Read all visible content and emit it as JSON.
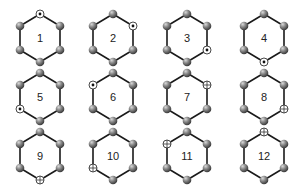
{
  "diagram": {
    "title": "",
    "colors": {
      "bond": "#1a1a1a",
      "atom": "#6b6b6b",
      "atom_highlight": "#bdbdbd",
      "marker_fill": "#ffffff",
      "marker_stroke": "#333333",
      "label": "#222222"
    },
    "vertex_order": [
      "top",
      "upper-right",
      "lower-right",
      "bottom",
      "lower-left",
      "upper-left"
    ],
    "hexagons": [
      {
        "label": "1",
        "cx": 40,
        "cy": 38,
        "marker_vertex": "top",
        "marker_type": "dot"
      },
      {
        "label": "2",
        "cx": 113,
        "cy": 38,
        "marker_vertex": "upper-right",
        "marker_type": "dot"
      },
      {
        "label": "3",
        "cx": 187,
        "cy": 38,
        "marker_vertex": "lower-right",
        "marker_type": "dot"
      },
      {
        "label": "4",
        "cx": 264,
        "cy": 38,
        "marker_vertex": "bottom",
        "marker_type": "dot"
      },
      {
        "label": "5",
        "cx": 40,
        "cy": 97,
        "marker_vertex": "lower-left",
        "marker_type": "dot"
      },
      {
        "label": "6",
        "cx": 113,
        "cy": 97,
        "marker_vertex": "upper-left",
        "marker_type": "dot"
      },
      {
        "label": "7",
        "cx": 187,
        "cy": 97,
        "marker_vertex": "upper-right",
        "marker_type": "cross"
      },
      {
        "label": "8",
        "cx": 264,
        "cy": 97,
        "marker_vertex": "lower-right",
        "marker_type": "cross"
      },
      {
        "label": "9",
        "cx": 40,
        "cy": 156,
        "marker_vertex": "bottom",
        "marker_type": "cross"
      },
      {
        "label": "10",
        "cx": 113,
        "cy": 156,
        "marker_vertex": "lower-left",
        "marker_type": "cross"
      },
      {
        "label": "11",
        "cx": 187,
        "cy": 156,
        "marker_vertex": "upper-left",
        "marker_type": "cross"
      },
      {
        "label": "12",
        "cx": 264,
        "cy": 156,
        "marker_vertex": "top",
        "marker_type": "cross"
      }
    ]
  }
}
